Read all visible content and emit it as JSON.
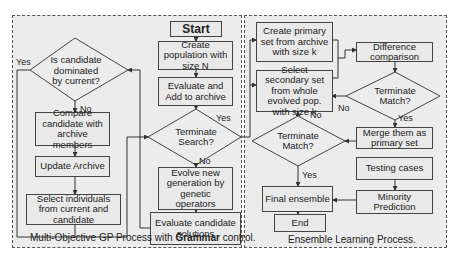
{
  "left_panel": {
    "caption_pre": "Multi-Objective GP Process with ",
    "caption_bold": "Grammar",
    "caption_post": " control.",
    "nodes": {
      "start": "Start",
      "create_population": "Create population with size N",
      "evaluate_add": "Evaluate and Add to archive",
      "terminate_search": "Terminate Search?",
      "evolve": "Evolve new generation by genetic operators",
      "evaluate_candidate": "Evaluate candidate solutions",
      "is_dominated": "Is candidate dominated by current?",
      "compare": "Compare candidate with archive members",
      "update_archive": "Update Archive",
      "select_individuals": "Select individuals from current and candidate"
    },
    "edge_labels": {
      "dominated_yes": "Yes",
      "dominated_no": "No",
      "search_yes": "Yes",
      "search_no": "No"
    }
  },
  "right_panel": {
    "caption": "Ensemble Learning Process.",
    "nodes": {
      "create_primary": "Create primary set from archive with size k",
      "select_secondary": "Select secondary set from whole evolved pop. with size k",
      "difference": "Difference comparison",
      "terminate_match_1": "Terminate Match?",
      "merge": "Merge them as primary set",
      "terminate_match_2": "Terminate Match?",
      "testing": "Testing cases",
      "minority": "Minority Prediction",
      "final_ensemble": "Final ensemble",
      "end": "End"
    },
    "edge_labels": {
      "match1_no": "No",
      "match1_yes": "Yes",
      "match2_no": "No",
      "match2_yes": "Yes"
    }
  },
  "colors": {
    "panel_bg": "#ececec",
    "box_border": "#444444",
    "line": "#333333"
  }
}
